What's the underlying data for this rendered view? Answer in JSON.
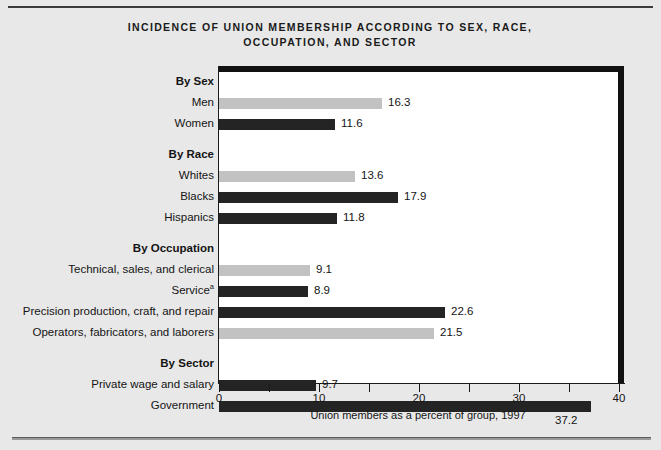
{
  "title": "INCIDENCE OF UNION MEMBERSHIP ACCORDING TO SEX, RACE, OCCUPATION, AND SECTOR",
  "title_line1": "INCIDENCE OF UNION MEMBERSHIP ACCORDING TO SEX, RACE,",
  "title_line2": "OCCUPATION, AND SECTOR",
  "axis": {
    "xlabel": "Union members as a percent of group, 1997",
    "tick_labels": [
      "0",
      "10",
      "20",
      "30",
      "40"
    ],
    "tick_values": [
      0,
      10,
      20,
      30,
      40
    ],
    "minor_tick_values": [
      5,
      15,
      25,
      35
    ],
    "xmin": 0,
    "xmax": 40
  },
  "colors": {
    "bar_light": "#c2c2c2",
    "bar_dark": "#242424",
    "plot_background": "#ffffff",
    "page_background": "#e8e8e8",
    "frame": "#111111",
    "text": "#141414"
  },
  "chart_data": {
    "type": "bar",
    "orientation": "horizontal",
    "title": "INCIDENCE OF UNION MEMBERSHIP ACCORDING TO SEX, RACE, OCCUPATION, AND SECTOR",
    "xlabel": "Union members as a percent of group, 1997",
    "ylabel": "",
    "xlim": [
      0,
      40
    ],
    "xticks": [
      0,
      10,
      20,
      30,
      40
    ],
    "grid": false,
    "legend": null,
    "groups": [
      {
        "group_label": "By Sex",
        "items": [
          {
            "label": "Men",
            "value": 16.3,
            "shade": "light"
          },
          {
            "label": "Women",
            "value": 11.6,
            "shade": "dark"
          }
        ]
      },
      {
        "group_label": "By Race",
        "items": [
          {
            "label": "Whites",
            "value": 13.6,
            "shade": "light"
          },
          {
            "label": "Blacks",
            "value": 17.9,
            "shade": "dark"
          },
          {
            "label": "Hispanics",
            "value": 11.8,
            "shade": "dark"
          }
        ]
      },
      {
        "group_label": "By Occupation",
        "items": [
          {
            "label": "Technical, sales, and clerical",
            "value": 9.1,
            "shade": "light"
          },
          {
            "label": "Service",
            "footnote": "a",
            "value": 8.9,
            "shade": "dark"
          },
          {
            "label": "Precision production, craft, and repair",
            "value": 22.6,
            "shade": "dark"
          },
          {
            "label": "Operators, fabricators, and laborers",
            "value": 21.5,
            "shade": "light"
          }
        ]
      },
      {
        "group_label": "By Sector",
        "items": [
          {
            "label": "Private wage and salary",
            "value": 9.7,
            "shade": "dark"
          },
          {
            "label": "Government",
            "value": 37.2,
            "shade": "dark",
            "value_below": true
          }
        ]
      }
    ],
    "categories": [
      "Men",
      "Women",
      "Whites",
      "Blacks",
      "Hispanics",
      "Technical, sales, and clerical",
      "Service",
      "Precision production, craft, and repair",
      "Operators, fabricators, and laborers",
      "Private wage and salary",
      "Government"
    ],
    "values": [
      16.3,
      11.6,
      13.6,
      17.9,
      11.8,
      9.1,
      8.9,
      22.6,
      21.5,
      9.7,
      37.2
    ]
  }
}
